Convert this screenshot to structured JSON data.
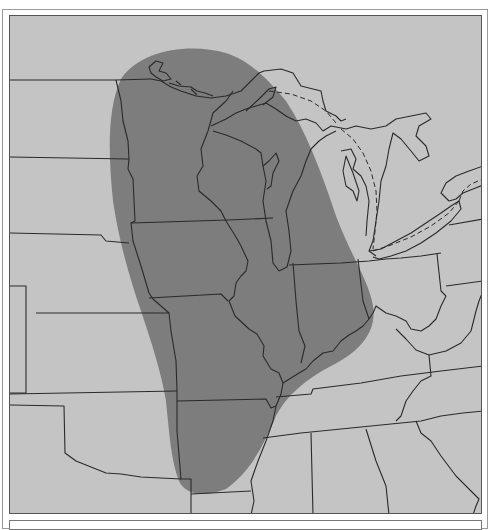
{
  "map": {
    "type": "regional shaded-area map",
    "region": "Central and Eastern United States / Great Lakes",
    "colors": {
      "background": "#c4c4c4",
      "shaded_region": "#7d7d7d",
      "border_lines": "#2a2a2a",
      "frame": "#555555"
    },
    "shaded_area_description": "Elongated oval region covering Minnesota, Wisconsin, Iowa, Illinois, Missouri, Indiana, Upper Michigan, western Lower Michigan and northern Arkansas",
    "legend": [],
    "labels": [],
    "dashed_lines": "Dashed routes across Lake Superior, Lake Huron and Lake Erie/Ontario"
  },
  "caption": {
    "text": ""
  }
}
